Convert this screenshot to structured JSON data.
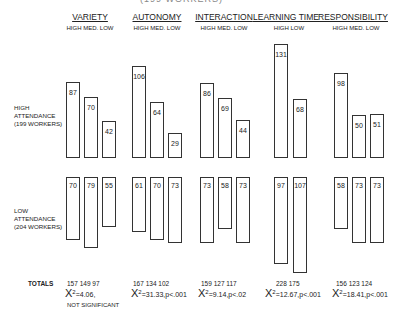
{
  "chart_data": {
    "type": "bar",
    "title": "(199 WORKERS)",
    "groups": [
      {
        "name": "VARIETY",
        "levels": [
          "HIGH",
          "MED.",
          "LOW"
        ],
        "high_attendance": [
          87,
          70,
          42
        ],
        "low_attendance": [
          70,
          79,
          55
        ],
        "totals": [
          157,
          149,
          97
        ],
        "chi_sq": "X² = 4.06,",
        "significance": "NOT SIGNIFICANT"
      },
      {
        "name": "AUTONOMY",
        "levels": [
          "HIGH",
          "MED.",
          "LOW"
        ],
        "high_attendance": [
          106,
          64,
          29
        ],
        "low_attendance": [
          61,
          70,
          73
        ],
        "totals": [
          167,
          134,
          102
        ],
        "chi_sq": "X² = 31.33, p < .001",
        "significance": ""
      },
      {
        "name": "INTERACTION",
        "levels": [
          "HIGH",
          "MED.",
          "LOW"
        ],
        "high_attendance": [
          86,
          69,
          44
        ],
        "low_attendance": [
          73,
          58,
          73
        ],
        "totals": [
          159,
          127,
          117
        ],
        "chi_sq": "X² = 9.14, p < .02",
        "significance": ""
      },
      {
        "name": "LEARNING TIME",
        "levels": [
          "HIGH",
          "LOW"
        ],
        "high_attendance": [
          131,
          68
        ],
        "low_attendance": [
          97,
          107
        ],
        "totals": [
          228,
          175
        ],
        "chi_sq": "X² = 12.67, p < .001",
        "significance": ""
      },
      {
        "name": "RESPONSIBILITY",
        "levels": [
          "HIGH",
          "MED.",
          "LOW"
        ],
        "high_attendance": [
          98,
          50,
          51
        ],
        "low_attendance": [
          58,
          73,
          73
        ],
        "totals": [
          156,
          123,
          124
        ],
        "chi_sq": "X² = 18.41, p < .001",
        "significance": ""
      }
    ],
    "row_labels": {
      "high": [
        "HIGH",
        "ATTENDANCE",
        "(199 WORKERS)"
      ],
      "low": [
        "LOW",
        "ATTENDANCE",
        "(204 WORKERS)"
      ]
    },
    "totals_label": "TOTALS",
    "grid": false
  },
  "labels": {
    "top_cut": "(199 WORKERS)",
    "g0": {
      "name": "VARIETY",
      "sub": "HIGH  MED. LOW",
      "tot": "157   149   97",
      "chi": "=4.06,",
      "note": "NOT SIGNIFICANT"
    },
    "g1": {
      "name": "AUTONOMY",
      "sub": "HIGH  MED. LOW",
      "tot": "167   134   102",
      "chi": "=31.33,p<.001"
    },
    "g2": {
      "name": "INTERACTION",
      "sub": "HIGH  MED. LOW",
      "tot": "159   127   117",
      "chi": "=9.14,p<.02"
    },
    "g3": {
      "name": "LEARNING TIME",
      "sub": "HIGH   LOW",
      "tot": "228   175",
      "chi": "=12.67,p<.001"
    },
    "g4": {
      "name": "RESPONSIBILITY",
      "sub": "HIGH  MED. LOW",
      "tot": "156   123   124",
      "chi": "=18.41,p<.001"
    },
    "high_row": [
      "HIGH",
      "ATTENDANCE",
      "(199 WORKERS)"
    ],
    "low_row": [
      "LOW",
      "ATTENDANCE",
      "(204 WORKERS)"
    ],
    "totals": "TOTALS",
    "chi_symbol": "X",
    "chi_exp": "2"
  }
}
